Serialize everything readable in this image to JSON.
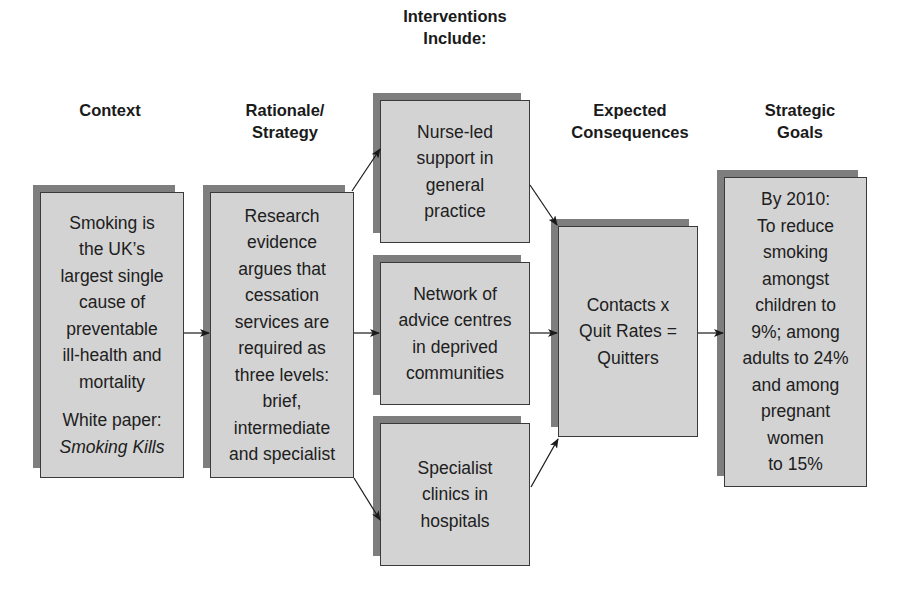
{
  "columns": [
    {
      "id": "context",
      "heading": "Context"
    },
    {
      "id": "rationale",
      "heading": "Rationale/\nStrategy"
    },
    {
      "id": "interventions",
      "heading": "Interventions\nInclude:"
    },
    {
      "id": "consequences",
      "heading": "Expected\nConsequences"
    },
    {
      "id": "goals",
      "heading": "Strategic\nGoals"
    }
  ],
  "boxes": {
    "context": {
      "lines": [
        "Smoking is",
        "the UK’s",
        "largest single",
        "cause of",
        "preventable",
        "ill-health and",
        "mortality"
      ],
      "white_paper_label": "White paper:",
      "white_paper_title": "Smoking Kills"
    },
    "rationale": {
      "lines": [
        "Research",
        "evidence",
        "argues that",
        "cessation",
        "services are",
        "required as",
        "three levels:",
        "brief,",
        "intermediate",
        "and specialist"
      ]
    },
    "interventions": [
      {
        "lines": [
          "Nurse-led",
          "support in",
          "general",
          "practice"
        ]
      },
      {
        "lines": [
          "Network of",
          "advice centres",
          "in deprived",
          "communities"
        ]
      },
      {
        "lines": [
          "Specialist",
          "clinics in",
          "hospitals"
        ]
      }
    ],
    "consequences": {
      "lines": [
        "Contacts x",
        "Quit Rates =",
        "Quitters"
      ]
    },
    "goals": {
      "lines": [
        "By 2010:",
        "To reduce",
        "smoking",
        "amongst",
        "children to",
        "9%; among",
        "adults to 24%",
        "and among",
        "pregnant",
        "women",
        "to 15%"
      ]
    }
  },
  "colors": {
    "box_fill": "#d3d3d3",
    "box_shadow": "#7e7e7e",
    "box_border": "#3a3a3a",
    "arrow": "#1a1a1a"
  }
}
